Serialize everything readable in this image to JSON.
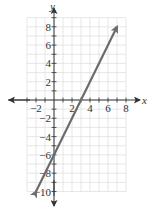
{
  "chart_data": {
    "type": "line",
    "title": "",
    "xlabel": "x",
    "ylabel": "y",
    "xlim": [
      -3,
      8
    ],
    "ylim": [
      -10,
      9
    ],
    "grid": true,
    "x_ticks": [
      -2,
      2,
      4,
      6,
      8
    ],
    "y_ticks": [
      8,
      6,
      4,
      2,
      -2,
      -4,
      -6,
      -8,
      -10
    ],
    "x_tick_labels": [
      "−2",
      "2",
      "4",
      "6",
      "8"
    ],
    "y_tick_labels": [
      "8",
      "6",
      "4",
      "2",
      "−2",
      "−4",
      "−6",
      "−8",
      "−10"
    ],
    "series": [
      {
        "name": "y = 2x − 6",
        "equation": "y = 2x - 6",
        "x": [
          -2,
          7
        ],
        "y": [
          -10,
          8
        ],
        "arrows_both_ends": true,
        "color": "#6b6b6b"
      }
    ]
  },
  "axes": {
    "x_label": "x",
    "y_label": "y"
  },
  "colors": {
    "line": "#6b6b6b",
    "grid": "#dcdcdc",
    "axis": "#333333"
  }
}
